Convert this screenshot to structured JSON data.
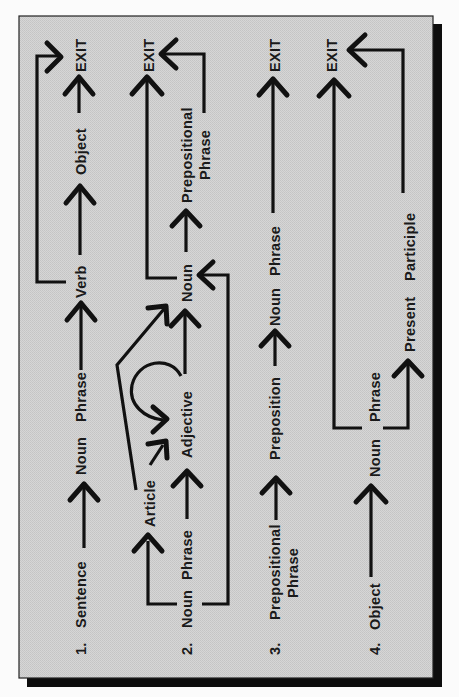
{
  "diagram": {
    "orientation": "rotated-90-ccw",
    "colors": {
      "panel": "#d2d2d2",
      "ink": "#111111",
      "shadow": "#0d0d0d",
      "page": "#fbfbfb"
    },
    "rows": [
      {
        "number": "1.",
        "nodes": [
          "Sentence",
          "Noun Phrase",
          "Verb",
          "Object",
          "EXIT"
        ],
        "labels": {
          "start": "Sentence",
          "np_noun": "Noun",
          "np_phrase": "Phrase",
          "verb": "Verb",
          "object": "Object",
          "exit": "EXIT"
        },
        "edges": [
          [
            "Sentence",
            "Noun Phrase"
          ],
          [
            "Noun Phrase",
            "Verb"
          ],
          [
            "Verb",
            "Object"
          ],
          [
            "Object",
            "EXIT"
          ],
          [
            "Verb",
            "EXIT"
          ]
        ]
      },
      {
        "number": "2.",
        "nodes": [
          "Noun Phrase",
          "Article",
          "Adjective",
          "Noun",
          "Prepositional Phrase",
          "EXIT"
        ],
        "labels": {
          "start_noun": "Noun",
          "start_phrase": "Phrase",
          "article": "Article",
          "adjective": "Adjective",
          "noun": "Noun",
          "pp_line1": "Prepositional",
          "pp_line2": "Phrase",
          "exit": "EXIT"
        },
        "edges": [
          [
            "Noun Phrase",
            "Article"
          ],
          [
            "Noun Phrase",
            "Adjective"
          ],
          [
            "Noun Phrase",
            "Noun"
          ],
          [
            "Article",
            "Adjective"
          ],
          [
            "Article",
            "Noun"
          ],
          [
            "Adjective",
            "Adjective"
          ],
          [
            "Adjective",
            "Noun"
          ],
          [
            "Noun",
            "Prepositional Phrase"
          ],
          [
            "Noun",
            "EXIT"
          ],
          [
            "Prepositional Phrase",
            "EXIT"
          ]
        ]
      },
      {
        "number": "3.",
        "nodes": [
          "Prepositional Phrase",
          "Preposition",
          "Noun Phrase",
          "EXIT"
        ],
        "labels": {
          "start_line1": "Prepositional",
          "start_line2": "Phrase",
          "preposition": "Preposition",
          "np_noun": "Noun",
          "np_phrase": "Phrase",
          "exit": "EXIT"
        },
        "edges": [
          [
            "Prepositional Phrase",
            "Preposition"
          ],
          [
            "Preposition",
            "Noun Phrase"
          ],
          [
            "Noun Phrase",
            "EXIT"
          ]
        ]
      },
      {
        "number": "4.",
        "nodes": [
          "Object",
          "Noun Phrase",
          "Present Participle",
          "EXIT"
        ],
        "labels": {
          "start": "Object",
          "np_noun": "Noun",
          "np_phrase": "Phrase",
          "pp_present": "Present",
          "pp_participle": "Participle",
          "exit": "EXIT"
        },
        "edges": [
          [
            "Object",
            "Noun Phrase"
          ],
          [
            "Noun Phrase",
            "Present Participle"
          ],
          [
            "Noun Phrase",
            "EXIT"
          ],
          [
            "Present Participle",
            "EXIT"
          ]
        ]
      }
    ]
  }
}
